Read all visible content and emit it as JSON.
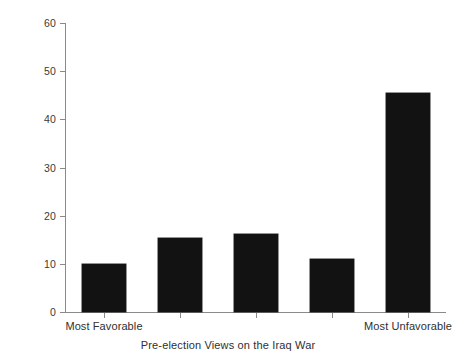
{
  "chart_data": {
    "type": "bar",
    "title": "",
    "subtitle": "",
    "xlabel": "Pre-election Views on the Iraq War",
    "ylabel": "Percent",
    "categories": [
      "Most Favorable",
      "2",
      "3",
      "4",
      "Most Unfavorable"
    ],
    "tick_labels_visible": [
      "Most Favorable",
      "",
      "",
      "",
      "Most Unfavorable"
    ],
    "values": [
      10.0,
      15.4,
      16.1,
      11.0,
      45.5
    ],
    "ylim": [
      0,
      60
    ],
    "yticks": [
      0,
      10,
      20,
      30,
      40,
      50,
      60
    ],
    "ytick_labels": [
      "0",
      "10",
      "20",
      "30",
      "40",
      "50",
      "60"
    ],
    "xlim": [
      0.5,
      5.5
    ],
    "grid": false,
    "legend": false,
    "legend_position": "none",
    "bar_color": "#121212",
    "axis_color": "#8a8a8a",
    "background_color": "#ffffff"
  },
  "axes": {
    "y_title": "Percent",
    "x_title": "Pre-election Views on the Iraq War"
  }
}
